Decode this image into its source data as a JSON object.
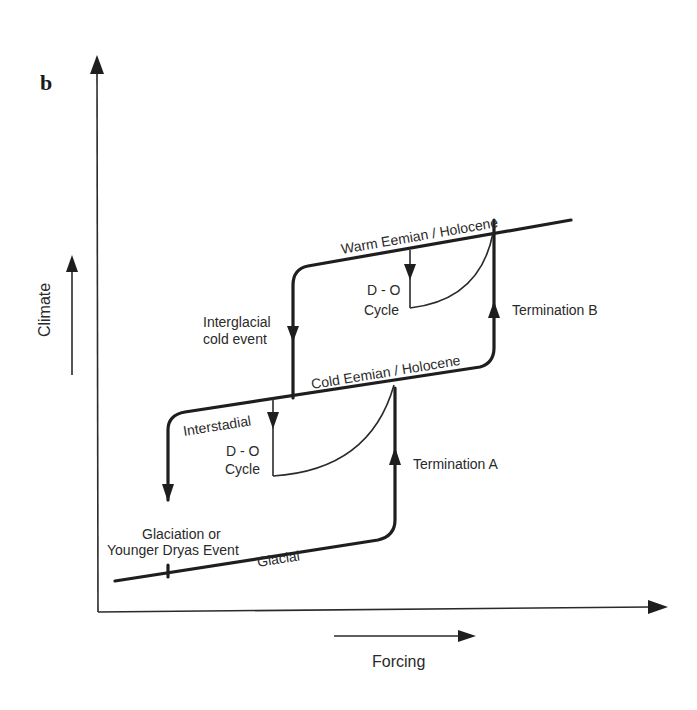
{
  "figure": {
    "panel_label": "b",
    "y_axis_label": "Climate",
    "x_axis_label": "Forcing",
    "branches": {
      "warm": "Warm Eemian / Holocene",
      "cold": "Cold Eemian / Holocene",
      "glacial": "Glacial"
    },
    "transitions": {
      "interglacial_cold_event_line1": "Interglacial",
      "interglacial_cold_event_line2": "cold event",
      "termination_b": "Termination B",
      "termination_a": "Termination A",
      "interstadial": "Interstadial",
      "glaciation_line1": "Glaciation or",
      "glaciation_line2": "Younger Dryas Event"
    },
    "do_cycle_upper": {
      "line1": "D - O",
      "line2": "Cycle"
    },
    "do_cycle_lower": {
      "line1": "D - O",
      "line2": "Cycle"
    },
    "colors": {
      "ink": "#1e1e1e",
      "background": "#ffffff"
    }
  }
}
